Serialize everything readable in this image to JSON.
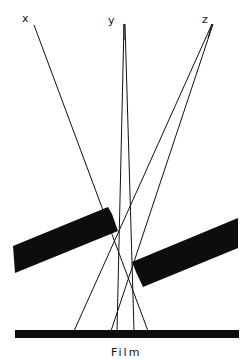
{
  "labels": {
    "source_x": "x",
    "source_y": "y",
    "source_z": "z",
    "film": "Film"
  },
  "colors": {
    "ink": "#0d0d0d",
    "background": "#ffffff"
  }
}
